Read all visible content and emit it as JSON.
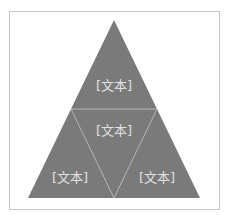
{
  "header": {
    "cut_off_text": ""
  },
  "diagram": {
    "type": "triangle-pyramid",
    "fill_color": "#7a7a7a",
    "line_color": "#bdbdbd",
    "frame_color": "#c8c8c8",
    "text_color": "#e2e2e2",
    "labels": {
      "top": "[文本]",
      "center": "[文本]",
      "bottom_left": "[文本]",
      "bottom_right": "[文本]"
    }
  }
}
